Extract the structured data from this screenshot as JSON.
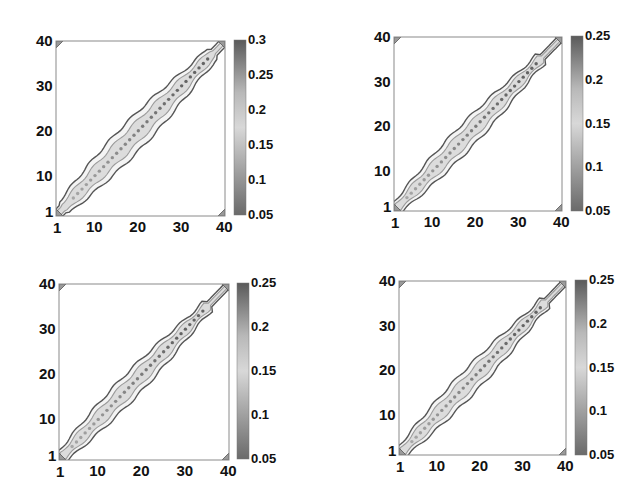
{
  "chart_data": [
    {
      "type": "heatmap",
      "subtype": "contour",
      "position": "top-left",
      "title": "",
      "xlabel": "",
      "ylabel": "",
      "xlim": [
        1,
        40
      ],
      "ylim": [
        1,
        40
      ],
      "x_ticks": [
        "1",
        "10",
        "20",
        "30",
        "40"
      ],
      "y_ticks": [
        "1",
        "10",
        "20",
        "30",
        "40"
      ],
      "colorbar": {
        "min": 0.05,
        "max": 0.3,
        "ticks": [
          "0.3",
          "0.25",
          "0.2",
          "0.15",
          "0.1",
          "0.05"
        ]
      },
      "description": "Diagonal band of high values along i=j from ~(3,3) to (40,40); band widest near 20-30 with peak ~0.25-0.3 dots along the diagonal; small blobs near origin and corners",
      "band": {
        "start": 3,
        "end": 37,
        "half_width_outer": 3.2,
        "half_width_inner": 1.8,
        "peak_value": 0.27
      }
    },
    {
      "type": "heatmap",
      "subtype": "contour",
      "position": "top-right",
      "title": "",
      "xlabel": "",
      "ylabel": "",
      "xlim": [
        1,
        40
      ],
      "ylim": [
        1,
        40
      ],
      "x_ticks": [
        "1",
        "10",
        "20",
        "30",
        "40"
      ],
      "y_ticks": [
        "1",
        "10",
        "20",
        "30",
        "40"
      ],
      "colorbar": {
        "min": 0.05,
        "max": 0.25,
        "ticks": [
          "0.25",
          "0.2",
          "0.15",
          "0.1",
          "0.05"
        ]
      },
      "description": "Narrow diagonal band from (1,1) to (40,40), widest around 15-32 with dotted peaks ~0.2-0.25",
      "band": {
        "start": 2,
        "end": 35,
        "half_width_outer": 2.6,
        "half_width_inner": 1.5,
        "peak_value": 0.22
      }
    },
    {
      "type": "heatmap",
      "subtype": "contour",
      "position": "bottom-left",
      "title": "",
      "xlabel": "",
      "ylabel": "",
      "xlim": [
        1,
        40
      ],
      "ylim": [
        1,
        40
      ],
      "x_ticks": [
        "1",
        "10",
        "20",
        "30",
        "40"
      ],
      "y_ticks": [
        "1",
        "10",
        "20",
        "30",
        "40"
      ],
      "colorbar": {
        "min": 0.05,
        "max": 0.25,
        "ticks": [
          "0.25",
          "0.2",
          "0.15",
          "0.1",
          "0.05"
        ]
      },
      "description": "Narrow diagonal band from (1,1) to (40,40), widest around 15-32 with dotted peaks ~0.2-0.25",
      "band": {
        "start": 2,
        "end": 35,
        "half_width_outer": 2.6,
        "half_width_inner": 1.5,
        "peak_value": 0.22
      }
    },
    {
      "type": "heatmap",
      "subtype": "contour",
      "position": "bottom-right",
      "title": "",
      "xlabel": "",
      "ylabel": "",
      "xlim": [
        1,
        40
      ],
      "ylim": [
        1,
        40
      ],
      "x_ticks": [
        "1",
        "10",
        "20",
        "30",
        "40"
      ],
      "y_ticks": [
        "1",
        "10",
        "20",
        "30",
        "40"
      ],
      "colorbar": {
        "min": 0.05,
        "max": 0.25,
        "ticks": [
          "0.25",
          "0.2",
          "0.15",
          "0.1",
          "0.05"
        ]
      },
      "description": "Narrow diagonal band from (1,1) to (40,40), widest around 15-32 with dotted peaks ~0.2-0.25",
      "band": {
        "start": 2,
        "end": 35,
        "half_width_outer": 2.6,
        "half_width_inner": 1.5,
        "peak_value": 0.22
      }
    }
  ],
  "layout": {
    "panels": [
      {
        "ax": [
          56,
          41,
          225,
          216
        ],
        "cb": [
          234,
          40,
          246,
          215
        ]
      },
      {
        "ax": [
          394,
          37,
          562,
          211
        ],
        "cb": [
          571,
          36,
          583,
          211
        ]
      },
      {
        "ax": [
          59,
          284,
          229,
          460
        ],
        "cb": [
          237,
          283,
          249,
          459
        ]
      },
      {
        "ax": [
          399,
          281,
          566,
          455
        ],
        "cb": [
          575,
          280,
          587,
          455
        ]
      }
    ]
  },
  "colors": {
    "frame": "#8a8a8a",
    "contour_dark": "#555555",
    "contour_mid": "#9a9a9a",
    "band_fill": "#dcdcdc",
    "dot": "#7a7a7a",
    "cb_top": "#5a5a5a",
    "cb_mid": "#d8d8d8",
    "cb_bottom": "#6a6a6a"
  }
}
